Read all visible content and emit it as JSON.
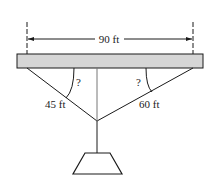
{
  "diagram": {
    "span_label": "90 ft",
    "left_cable_label": "45 ft",
    "right_cable_label": "60 ft",
    "left_angle_label": "?",
    "right_angle_label": "?",
    "colors": {
      "beam_fill": "#d6d6d6",
      "line": "#1a1a1a"
    }
  }
}
